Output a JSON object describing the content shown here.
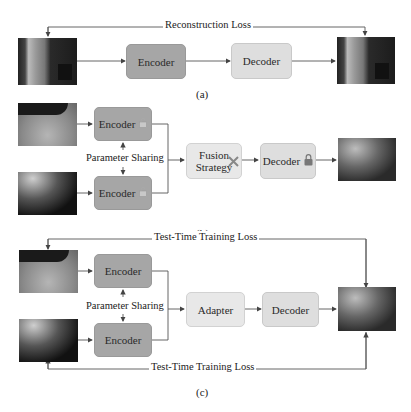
{
  "panel_a": {
    "loss_label": "Reconstruction Loss",
    "encoder_label": "Encoder",
    "decoder_label": "Decoder",
    "caption": "(a)",
    "input_image": "indoor-room-scene",
    "output_image": "indoor-room-scene-reconstructed"
  },
  "panel_b": {
    "encoder_top_label": "Encoder",
    "encoder_bottom_label": "Encoder",
    "sharing_label": "Parameter Sharing",
    "fusion_label_line1": "Fusion",
    "fusion_label_line2": "Strategy",
    "decoder_label": "Decoder",
    "caption": "(b)",
    "input_top_image": "bright-outdoor-scene",
    "input_bottom_image": "dark-outdoor-scene",
    "output_image": "fused-outdoor-scene",
    "icons": {
      "encoder_top": "lock-open-icon",
      "encoder_bottom": "lock-open-icon",
      "fusion": "tools-icon",
      "decoder": "lock-icon"
    }
  },
  "panel_c": {
    "loss_top_label": "Test-Time Training Loss",
    "loss_bottom_label": "Test-Time Training Loss",
    "encoder_top_label": "Encoder",
    "encoder_bottom_label": "Encoder",
    "sharing_label": "Parameter Sharing",
    "adapter_label": "Adapter",
    "decoder_label": "Decoder",
    "caption": "(c)",
    "input_top_image": "bright-outdoor-scene",
    "input_bottom_image": "dark-outdoor-scene",
    "output_image": "fused-outdoor-scene"
  },
  "colors": {
    "encoder_fill": "#a6a6a6",
    "decoder_fill": "#dedede",
    "adapter_fill": "#e8e8e8",
    "line": "#555555"
  }
}
